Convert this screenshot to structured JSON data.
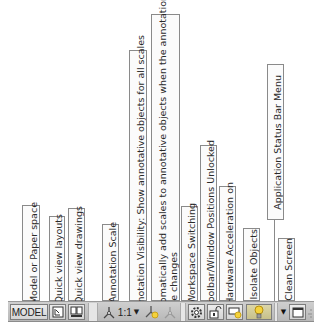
{
  "callouts": [
    {
      "id": "model-or-paper-space",
      "label": "Model or Paper space"
    },
    {
      "id": "quick-view-layouts",
      "label": "Quick view layouts"
    },
    {
      "id": "quick-view-drawings",
      "label": "Quick view drawings"
    },
    {
      "id": "annotation-scale",
      "label": "Annotation Scale"
    },
    {
      "id": "annotation-visibility",
      "label": "Annotation Visibility: Show annotative objects for all scales"
    },
    {
      "id": "auto-add-scales",
      "line1": "Automatically add scales to annotative objects when the annotation",
      "line2": "scale changes"
    },
    {
      "id": "workspace-switching",
      "label": "Workspace Switching"
    },
    {
      "id": "toolbar-window-positions",
      "label": "Toolbar/Window Positions Unlocked"
    },
    {
      "id": "hardware-acceleration",
      "label": "Hardware Acceleration on"
    },
    {
      "id": "isolate-objects",
      "label": "Isolate Objects"
    },
    {
      "id": "application-status-bar-menu",
      "label": "Application Status Bar Menu"
    },
    {
      "id": "clean-screen",
      "label": "Clean Screen"
    }
  ],
  "statusbar": {
    "model_label": "MODEL",
    "annotation_scale_value": "1:1",
    "icons": {
      "quick_view_layouts": "layout-icon",
      "quick_view_drawings": "drawings-icon",
      "annotation_scale": "annotation-scale-icon",
      "annotation_visibility": "annotation-visibility-icon",
      "auto_add_scales": "auto-scale-icon",
      "workspace": "gear-icon",
      "lock": "lock-icon",
      "hardware_accel": "hardware-acceleration-icon",
      "isolate": "lightbulb-icon",
      "menu": "dropdown-arrow-icon",
      "clean_screen": "clean-screen-icon"
    }
  },
  "colors": {
    "bar_bg": "#c4c4c4",
    "callout_border": "#8a8a8a",
    "bulb": "#f4d23c"
  }
}
